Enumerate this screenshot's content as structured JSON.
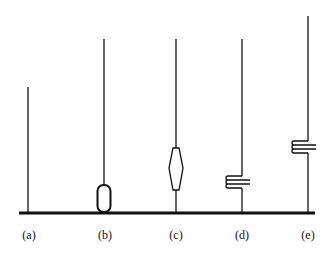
{
  "figure": {
    "colors": {
      "stroke": "#111111",
      "background": "#ffffff"
    },
    "antennas": [
      {
        "id": "a",
        "label": "(a)",
        "type": "plain-monopole",
        "x": 28
      },
      {
        "id": "b",
        "label": "(b)",
        "type": "base-loaded-capsule",
        "x": 104
      },
      {
        "id": "c",
        "label": "(c)",
        "type": "center-hexagonal-element",
        "x": 176
      },
      {
        "id": "d",
        "label": "(d)",
        "type": "low-coil-loaded",
        "x": 242
      },
      {
        "id": "e",
        "label": "(e)",
        "type": "mid-coil-loaded",
        "x": 308
      }
    ]
  }
}
